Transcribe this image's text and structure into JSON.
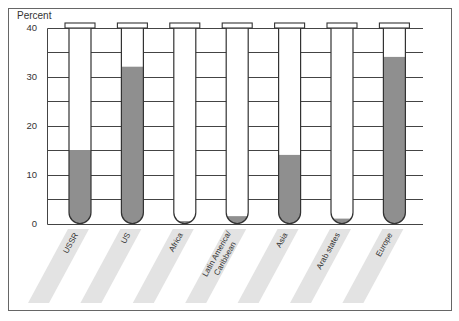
{
  "chart_data": {
    "type": "bar",
    "style": "test-tube bars",
    "title": "",
    "xlabel": "",
    "ylabel": "Percent",
    "categories": [
      "USSR",
      "US",
      "Africa",
      "Latin America/Caribbean",
      "Asia",
      "Arab states",
      "Europe"
    ],
    "category_label_lines": [
      [
        "USSR"
      ],
      [
        "US"
      ],
      [
        "Africa"
      ],
      [
        "Latin America/",
        "Caribbean"
      ],
      [
        "Asia"
      ],
      [
        "Arab states"
      ],
      [
        "Europe"
      ]
    ],
    "values": [
      15,
      32,
      0.5,
      1.5,
      14,
      1,
      34
    ],
    "ylim": [
      0,
      40
    ],
    "yticks": [
      0,
      10,
      20,
      30,
      40
    ],
    "ytick_labels": [
      "0",
      "10",
      "20",
      "30",
      "40"
    ],
    "gridline_step": 5,
    "grid": true,
    "legend": null,
    "category_label_orientation": "rotated ~61° on shaded diagonal bands"
  },
  "colors": {
    "fill": "#8f8f8f",
    "outline": "#333333",
    "label_band": "#e3e3e3",
    "frame": "#666666",
    "grid": "#444444",
    "text": "#333333",
    "background": "#ffffff"
  }
}
